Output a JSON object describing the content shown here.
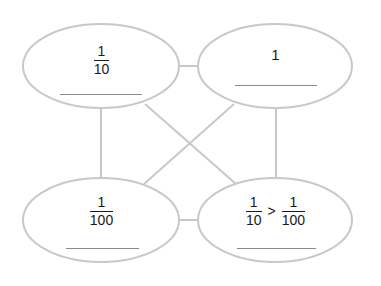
{
  "diagram": {
    "type": "four-ellipse frayer-style connection diagram",
    "line_color": "#c8c8c8",
    "text_color": "#1a1a1a",
    "nodes": [
      {
        "id": "top-left",
        "fraction": {
          "numerator": "1",
          "denominator": "10"
        },
        "answer_blank": ""
      },
      {
        "id": "top-right",
        "value": "1",
        "answer_blank": ""
      },
      {
        "id": "bottom-left",
        "fraction": {
          "numerator": "1",
          "denominator": "100"
        },
        "answer_blank": ""
      },
      {
        "id": "bottom-right",
        "comparison": {
          "left": {
            "numerator": "1",
            "denominator": "10"
          },
          "operator": ">",
          "right": {
            "numerator": "1",
            "denominator": "100"
          }
        },
        "answer_blank": ""
      }
    ],
    "connections": [
      [
        "top-left",
        "top-right"
      ],
      [
        "top-left",
        "bottom-left"
      ],
      [
        "top-right",
        "bottom-right"
      ],
      [
        "bottom-left",
        "bottom-right"
      ],
      [
        "top-left",
        "bottom-right"
      ],
      [
        "top-right",
        "bottom-left"
      ]
    ]
  }
}
